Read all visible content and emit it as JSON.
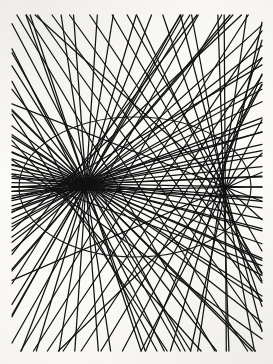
{
  "figure": {
    "type": "geometric-line-figure",
    "canvas": {
      "width": 273,
      "height": 364,
      "background_color": "#fbfaf7",
      "ink_color": "#141414"
    },
    "ellipse": {
      "label": "boundary-ellipse",
      "center_x": 135,
      "center_y": 187,
      "radius_x": 116,
      "radius_y": 70,
      "stroke_width": 1.15,
      "stroke_color": "#1a1a1a",
      "leftmost_x": 19,
      "rightmost_x": 251,
      "topmost_y": 117,
      "bottommost_y": 257
    },
    "radiant_point": {
      "label": "radiant-focus",
      "x": 86,
      "y": 184,
      "note": "convergence node where all rays meet"
    },
    "rays": {
      "label": "reflected-ray-family",
      "count": 46,
      "stroke_width": 1.25,
      "stroke_color": "#121212",
      "start_angle_deg": 0,
      "end_angle_deg": 360,
      "extension_note": "each reflected ray is extended as a straight line until it leaves the drawing frame",
      "inset_margin": 12
    },
    "frame": {
      "left_bound": 12,
      "right_bound": 262,
      "top_bound": 15,
      "bottom_bound": 351
    },
    "caustic": {
      "label": "envelope-caustic",
      "visible": true,
      "cusp_x": 86,
      "cusp_y": 184,
      "note": "cusp of the caustic coincides with the radiant point; envelope sweeps upward and downward through the middle of the figure"
    }
  }
}
